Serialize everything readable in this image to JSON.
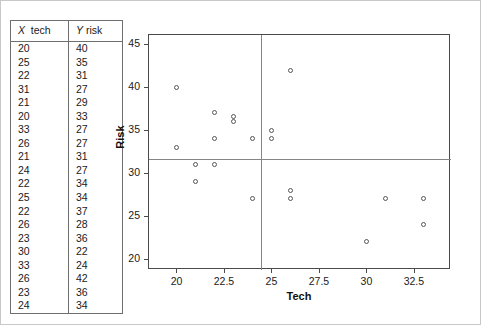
{
  "table": {
    "headers": {
      "x_var": "X",
      "x_name": "tech",
      "y_var": "Y",
      "y_name": "risk"
    },
    "rows": [
      {
        "x": "20",
        "y": "40"
      },
      {
        "x": "25",
        "y": "35"
      },
      {
        "x": "22",
        "y": "31"
      },
      {
        "x": "31",
        "y": "27"
      },
      {
        "x": "21",
        "y": "29"
      },
      {
        "x": "20",
        "y": "33"
      },
      {
        "x": "33",
        "y": "27"
      },
      {
        "x": "26",
        "y": "27"
      },
      {
        "x": "21",
        "y": "31"
      },
      {
        "x": "24",
        "y": "27"
      },
      {
        "x": "22",
        "y": "34"
      },
      {
        "x": "25",
        "y": "34"
      },
      {
        "x": "22",
        "y": "37"
      },
      {
        "x": "26",
        "y": "28"
      },
      {
        "x": "23",
        "y": "36"
      },
      {
        "x": "30",
        "y": "22"
      },
      {
        "x": "33",
        "y": "24"
      },
      {
        "x": "26",
        "y": "42"
      },
      {
        "x": "23",
        "y": "36"
      },
      {
        "x": "24",
        "y": "34"
      }
    ]
  },
  "chart_data": {
    "type": "scatter",
    "title": "",
    "xlabel": "Tech",
    "ylabel": "Risk",
    "xlim": [
      18.5,
      34.4
    ],
    "ylim": [
      18.8,
      46.2
    ],
    "xticks": [
      "20",
      "22.5",
      "25",
      "27.5",
      "30",
      "32.5"
    ],
    "xtick_values": [
      20,
      22.5,
      25,
      27.5,
      30,
      32.5
    ],
    "yticks": [
      "20",
      "25",
      "30",
      "35",
      "40",
      "45"
    ],
    "ytick_values": [
      20,
      25,
      30,
      35,
      40,
      45
    ],
    "grid": false,
    "legend": null,
    "marker": "open-circle",
    "reference_lines": {
      "vertical_x": 24.4,
      "horizontal_y": 31.7
    },
    "points": [
      {
        "x": 20,
        "y": 40
      },
      {
        "x": 25,
        "y": 35
      },
      {
        "x": 22,
        "y": 31
      },
      {
        "x": 31,
        "y": 27
      },
      {
        "x": 21,
        "y": 29
      },
      {
        "x": 20,
        "y": 33
      },
      {
        "x": 33,
        "y": 27
      },
      {
        "x": 26,
        "y": 27
      },
      {
        "x": 21,
        "y": 31
      },
      {
        "x": 24,
        "y": 27
      },
      {
        "x": 22,
        "y": 34
      },
      {
        "x": 25,
        "y": 34
      },
      {
        "x": 22,
        "y": 37
      },
      {
        "x": 26,
        "y": 28
      },
      {
        "x": 23,
        "y": 36
      },
      {
        "x": 30,
        "y": 22
      },
      {
        "x": 33,
        "y": 24
      },
      {
        "x": 26,
        "y": 42
      },
      {
        "x": 23,
        "y": 36
      },
      {
        "x": 24,
        "y": 34
      }
    ]
  },
  "colors": {
    "frame": "#4a4a4a",
    "marker": "#555555",
    "refline": "#868686",
    "text": "#1a1a1a"
  }
}
